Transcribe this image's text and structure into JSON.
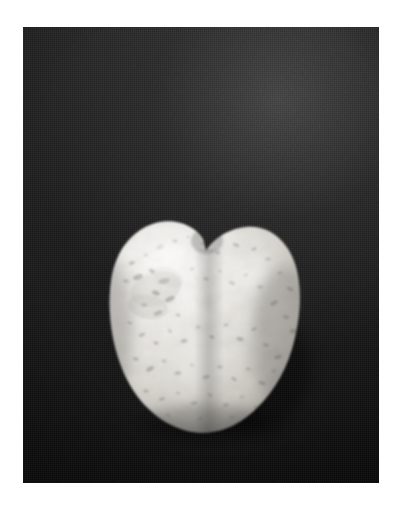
{
  "image": {
    "subject": "heart-shaped white speckled stone",
    "background_description": "dark textured cloth backdrop",
    "orientation": "portrait",
    "border_style": "white margin around photographic plate",
    "alt_text": "A heart-shaped white granite pebble with grey speckles resting on a dark cloth background"
  },
  "colors": {
    "page_background": "#ffffff",
    "backdrop_dark": "#161616",
    "backdrop_highlight": "#3e3e3e",
    "backdrop_shadow": "#0a0a0a",
    "stone_light": "#f2f1ed",
    "stone_mid": "#d9d7d1",
    "stone_shadow": "#8d8b86",
    "stone_speckle": "#5e5c58",
    "stone_edge_shadow": "#3a3936"
  },
  "geometry": {
    "canvas_width": 403,
    "canvas_height": 512,
    "plate_x": 23,
    "plate_y": 27,
    "plate_width": 356,
    "plate_height": 456,
    "stone_x": 108,
    "stone_y": 219,
    "stone_width": 196,
    "stone_height": 216,
    "notch_x": 203,
    "notch_y": 237,
    "left_lobe_peak_x": 155,
    "left_lobe_peak_y": 222,
    "right_lobe_peak_x": 250,
    "right_lobe_peak_y": 232
  },
  "speckles": [
    {
      "cx": 24,
      "cy": 44,
      "rx": 3.2,
      "ry": 2.0,
      "o": 0.3,
      "r": -18
    },
    {
      "cx": 38,
      "cy": 36,
      "rx": 2.2,
      "ry": 1.5,
      "o": 0.26,
      "r": 12
    },
    {
      "cx": 52,
      "cy": 28,
      "rx": 4.0,
      "ry": 2.2,
      "o": 0.22,
      "r": -30
    },
    {
      "cx": 67,
      "cy": 22,
      "rx": 2.6,
      "ry": 1.6,
      "o": 0.3,
      "r": 8
    },
    {
      "cx": 80,
      "cy": 18,
      "rx": 2.0,
      "ry": 1.3,
      "o": 0.2,
      "r": 0
    },
    {
      "cx": 95,
      "cy": 25,
      "rx": 3.0,
      "ry": 1.7,
      "o": 0.24,
      "r": 22
    },
    {
      "cx": 110,
      "cy": 34,
      "rx": 2.3,
      "ry": 1.5,
      "o": 0.28,
      "r": -10
    },
    {
      "cx": 128,
      "cy": 26,
      "rx": 3.4,
      "ry": 1.9,
      "o": 0.26,
      "r": 16
    },
    {
      "cx": 146,
      "cy": 30,
      "rx": 2.6,
      "ry": 1.6,
      "o": 0.3,
      "r": -24
    },
    {
      "cx": 160,
      "cy": 40,
      "rx": 3.0,
      "ry": 1.8,
      "o": 0.24,
      "r": 5
    },
    {
      "cx": 172,
      "cy": 54,
      "rx": 2.4,
      "ry": 1.5,
      "o": 0.28,
      "r": -14
    },
    {
      "cx": 182,
      "cy": 70,
      "rx": 3.6,
      "ry": 2.0,
      "o": 0.3,
      "r": 28
    },
    {
      "cx": 18,
      "cy": 62,
      "rx": 2.8,
      "ry": 1.7,
      "o": 0.28,
      "r": 10
    },
    {
      "cx": 30,
      "cy": 58,
      "rx": 5.0,
      "ry": 2.6,
      "o": 0.34,
      "r": -22
    },
    {
      "cx": 44,
      "cy": 52,
      "rx": 3.2,
      "ry": 2.0,
      "o": 0.36,
      "r": 34
    },
    {
      "cx": 56,
      "cy": 62,
      "rx": 6.0,
      "ry": 2.8,
      "o": 0.3,
      "r": -12
    },
    {
      "cx": 48,
      "cy": 74,
      "rx": 4.2,
      "ry": 2.4,
      "o": 0.38,
      "r": 20
    },
    {
      "cx": 62,
      "cy": 80,
      "rx": 5.4,
      "ry": 2.6,
      "o": 0.34,
      "r": -26
    },
    {
      "cx": 36,
      "cy": 86,
      "rx": 3.0,
      "ry": 1.8,
      "o": 0.3,
      "r": 6
    },
    {
      "cx": 50,
      "cy": 94,
      "rx": 4.6,
      "ry": 2.2,
      "o": 0.32,
      "r": -18
    },
    {
      "cx": 70,
      "cy": 96,
      "rx": 2.6,
      "ry": 1.6,
      "o": 0.26,
      "r": 14
    },
    {
      "cx": 84,
      "cy": 50,
      "rx": 2.2,
      "ry": 1.4,
      "o": 0.22,
      "r": 0
    },
    {
      "cx": 98,
      "cy": 60,
      "rx": 2.8,
      "ry": 1.6,
      "o": 0.24,
      "r": 18
    },
    {
      "cx": 112,
      "cy": 52,
      "rx": 2.0,
      "ry": 1.3,
      "o": 0.2,
      "r": -8
    },
    {
      "cx": 124,
      "cy": 64,
      "rx": 3.2,
      "ry": 1.8,
      "o": 0.28,
      "r": 26
    },
    {
      "cx": 138,
      "cy": 56,
      "rx": 2.4,
      "ry": 1.5,
      "o": 0.26,
      "r": -16
    },
    {
      "cx": 152,
      "cy": 68,
      "rx": 3.0,
      "ry": 1.7,
      "o": 0.3,
      "r": 10
    },
    {
      "cx": 166,
      "cy": 84,
      "rx": 4.0,
      "ry": 2.1,
      "o": 0.32,
      "r": -28
    },
    {
      "cx": 178,
      "cy": 98,
      "rx": 3.2,
      "ry": 1.8,
      "o": 0.3,
      "r": 20
    },
    {
      "cx": 186,
      "cy": 112,
      "rx": 4.4,
      "ry": 2.3,
      "o": 0.34,
      "r": -6
    },
    {
      "cx": 22,
      "cy": 104,
      "rx": 2.6,
      "ry": 1.6,
      "o": 0.26,
      "r": 12
    },
    {
      "cx": 34,
      "cy": 116,
      "rx": 3.4,
      "ry": 1.9,
      "o": 0.28,
      "r": -20
    },
    {
      "cx": 48,
      "cy": 124,
      "rx": 2.8,
      "ry": 1.7,
      "o": 0.3,
      "r": 8
    },
    {
      "cx": 62,
      "cy": 112,
      "rx": 2.2,
      "ry": 1.4,
      "o": 0.24,
      "r": 30
    },
    {
      "cx": 76,
      "cy": 122,
      "rx": 3.6,
      "ry": 2.0,
      "o": 0.3,
      "r": -14
    },
    {
      "cx": 90,
      "cy": 108,
      "rx": 2.4,
      "ry": 1.5,
      "o": 0.22,
      "r": 4
    },
    {
      "cx": 104,
      "cy": 118,
      "rx": 3.0,
      "ry": 1.7,
      "o": 0.28,
      "r": 22
    },
    {
      "cx": 118,
      "cy": 106,
      "rx": 2.6,
      "ry": 1.6,
      "o": 0.26,
      "r": -10
    },
    {
      "cx": 132,
      "cy": 120,
      "rx": 3.8,
      "ry": 2.0,
      "o": 0.32,
      "r": 16
    },
    {
      "cx": 146,
      "cy": 110,
      "rx": 2.8,
      "ry": 1.7,
      "o": 0.28,
      "r": -24
    },
    {
      "cx": 158,
      "cy": 126,
      "rx": 3.2,
      "ry": 1.8,
      "o": 0.3,
      "r": 6
    },
    {
      "cx": 170,
      "cy": 138,
      "rx": 4.0,
      "ry": 2.2,
      "o": 0.32,
      "r": -18
    },
    {
      "cx": 28,
      "cy": 140,
      "rx": 3.0,
      "ry": 1.8,
      "o": 0.28,
      "r": 14
    },
    {
      "cx": 42,
      "cy": 150,
      "rx": 4.2,
      "ry": 2.2,
      "o": 0.32,
      "r": -28
    },
    {
      "cx": 56,
      "cy": 142,
      "rx": 2.6,
      "ry": 1.6,
      "o": 0.26,
      "r": 10
    },
    {
      "cx": 70,
      "cy": 154,
      "rx": 3.4,
      "ry": 1.9,
      "o": 0.3,
      "r": -8
    },
    {
      "cx": 84,
      "cy": 146,
      "rx": 2.2,
      "ry": 1.4,
      "o": 0.24,
      "r": 20
    },
    {
      "cx": 98,
      "cy": 158,
      "rx": 3.6,
      "ry": 2.0,
      "o": 0.32,
      "r": -16
    },
    {
      "cx": 112,
      "cy": 148,
      "rx": 2.8,
      "ry": 1.7,
      "o": 0.28,
      "r": 8
    },
    {
      "cx": 126,
      "cy": 160,
      "rx": 3.0,
      "ry": 1.8,
      "o": 0.3,
      "r": 26
    },
    {
      "cx": 140,
      "cy": 150,
      "rx": 2.4,
      "ry": 1.5,
      "o": 0.26,
      "r": -12
    },
    {
      "cx": 154,
      "cy": 164,
      "rx": 3.8,
      "ry": 2.1,
      "o": 0.3,
      "r": 18
    },
    {
      "cx": 166,
      "cy": 152,
      "rx": 2.6,
      "ry": 1.6,
      "o": 0.26,
      "r": -22
    },
    {
      "cx": 38,
      "cy": 172,
      "rx": 2.8,
      "ry": 1.7,
      "o": 0.26,
      "r": 12
    },
    {
      "cx": 54,
      "cy": 180,
      "rx": 3.2,
      "ry": 1.8,
      "o": 0.28,
      "r": -18
    },
    {
      "cx": 70,
      "cy": 174,
      "rx": 2.4,
      "ry": 1.5,
      "o": 0.24,
      "r": 6
    },
    {
      "cx": 86,
      "cy": 184,
      "rx": 3.4,
      "ry": 1.9,
      "o": 0.28,
      "r": -10
    },
    {
      "cx": 102,
      "cy": 176,
      "rx": 2.6,
      "ry": 1.6,
      "o": 0.26,
      "r": 22
    },
    {
      "cx": 118,
      "cy": 186,
      "rx": 3.0,
      "ry": 1.7,
      "o": 0.26,
      "r": -14
    },
    {
      "cx": 134,
      "cy": 178,
      "rx": 2.2,
      "ry": 1.4,
      "o": 0.22,
      "r": 8
    },
    {
      "cx": 148,
      "cy": 188,
      "rx": 2.8,
      "ry": 1.6,
      "o": 0.24,
      "r": -26
    },
    {
      "cx": 60,
      "cy": 196,
      "rx": 2.6,
      "ry": 1.5,
      "o": 0.22,
      "r": 10
    },
    {
      "cx": 92,
      "cy": 200,
      "rx": 3.0,
      "ry": 1.6,
      "o": 0.22,
      "r": -16
    },
    {
      "cx": 124,
      "cy": 198,
      "rx": 2.4,
      "ry": 1.4,
      "o": 0.2,
      "r": 18
    }
  ]
}
